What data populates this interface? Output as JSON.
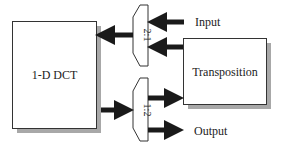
{
  "diagram": {
    "blocks": {
      "dct": {
        "label": "1-D DCT"
      },
      "transposition": {
        "label": "Transposition"
      },
      "mux_top": {
        "label": "2:1"
      },
      "mux_bottom": {
        "label": "1:2"
      }
    },
    "io": {
      "input_label": "Input",
      "output_label": "Output"
    },
    "colors": {
      "stroke": "#333333",
      "arrow": "#1a1a1a",
      "shadow": "#a8a8a8",
      "fill": "#ffffff"
    }
  }
}
